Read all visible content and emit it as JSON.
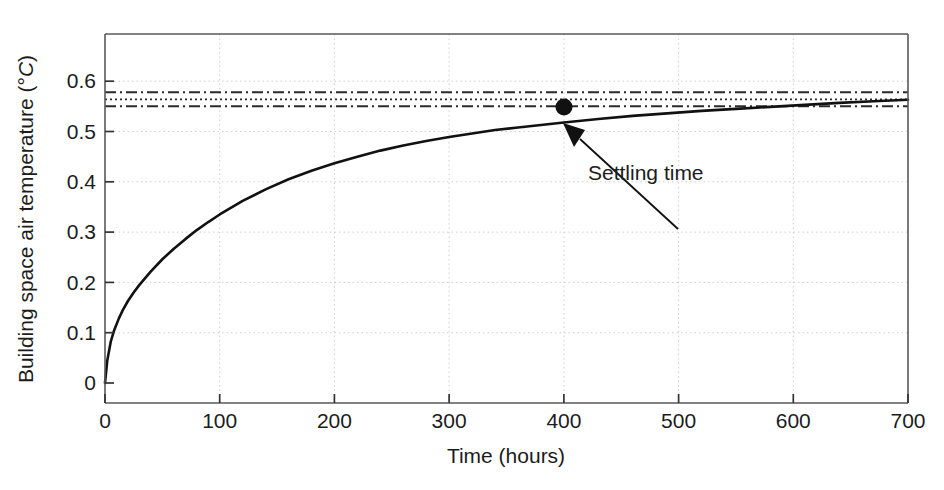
{
  "chart_data": {
    "type": "line",
    "title": "",
    "xlabel": "Time (hours)",
    "ylabel": "Building space air temperature (°C)",
    "ylabel_text": "Building space air temperature (",
    "ylabel_unit_deg": "°",
    "ylabel_unit_c": "C",
    "ylabel_close": ")",
    "xlim": [
      0,
      700
    ],
    "ylim": [
      0,
      0.68
    ],
    "grid": true,
    "legend": "none",
    "xticks": [
      0,
      100,
      200,
      300,
      400,
      500,
      600,
      700
    ],
    "xticklabels": [
      "0",
      "100",
      "200",
      "300",
      "400",
      "500",
      "600",
      "700"
    ],
    "yticks": [
      0,
      0.1,
      0.2,
      0.3,
      0.4,
      0.5,
      0.6
    ],
    "yticklabels": [
      "0",
      "0.1",
      "0.2",
      "0.3",
      "0.4",
      "0.5",
      "0.6"
    ],
    "series": [
      {
        "name": "Building space air temperature response",
        "style": "solid",
        "color": "#111111",
        "x": [
          0,
          2,
          5,
          8,
          12,
          16,
          20,
          25,
          30,
          40,
          50,
          60,
          70,
          80,
          90,
          100,
          120,
          140,
          160,
          180,
          200,
          220,
          240,
          260,
          280,
          300,
          320,
          340,
          360,
          380,
          400,
          430,
          460,
          490,
          520,
          550,
          580,
          610,
          640,
          670,
          700
        ],
        "y": [
          0,
          0.045,
          0.082,
          0.105,
          0.128,
          0.147,
          0.163,
          0.18,
          0.195,
          0.222,
          0.246,
          0.267,
          0.286,
          0.304,
          0.32,
          0.335,
          0.362,
          0.385,
          0.405,
          0.422,
          0.437,
          0.45,
          0.462,
          0.472,
          0.481,
          0.489,
          0.496,
          0.503,
          0.508,
          0.513,
          0.518,
          0.525,
          0.531,
          0.536,
          0.541,
          0.545,
          0.549,
          0.553,
          0.557,
          0.56,
          0.563
        ]
      }
    ],
    "reference_lines": [
      {
        "name": "upper-tolerance-band",
        "value": 0.582,
        "style": "dash-dot",
        "color": "#2a2a2a"
      },
      {
        "name": "steady-state-value",
        "value": 0.571,
        "style": "dotted",
        "color": "#2a2a2a"
      },
      {
        "name": "lower-tolerance-band",
        "value": 0.56,
        "style": "dash-dot",
        "color": "#2a2a2a"
      }
    ],
    "markers": [
      {
        "name": "settling-time-point",
        "x": 400,
        "y": 0.548,
        "shape": "circle",
        "color": "#111111"
      }
    ],
    "annotations": [
      {
        "name": "settling-time",
        "text": "Settling time",
        "text_x": 424,
        "text_y": 0.373,
        "arrow_from_x": 500,
        "arrow_from_y": 0.345,
        "arrow_to_x": 411,
        "arrow_to_y": 0.525
      }
    ]
  }
}
